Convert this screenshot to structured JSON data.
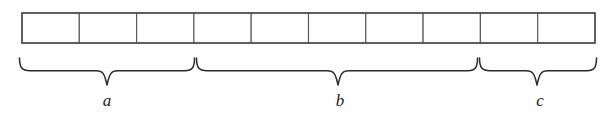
{
  "diagram": {
    "background_color": "#fefefe",
    "line_color": "#4a4a4a",
    "brace_color": "#2b2b2b",
    "label_color": "#1c1c1c",
    "bar": {
      "name": "segmented-bar",
      "x": 22,
      "y": 13,
      "width": 573,
      "height": 30,
      "cell_count": 10,
      "divider_positions": [
        79,
        136,
        193,
        250,
        307,
        364,
        421,
        478,
        535
      ],
      "cells": [
        {
          "index": 1,
          "value": ""
        },
        {
          "index": 2,
          "value": ""
        },
        {
          "index": 3,
          "value": ""
        },
        {
          "index": 4,
          "value": ""
        },
        {
          "index": 5,
          "value": ""
        },
        {
          "index": 6,
          "value": ""
        },
        {
          "index": 7,
          "value": ""
        },
        {
          "index": 8,
          "value": ""
        },
        {
          "index": 9,
          "value": ""
        },
        {
          "index": 10,
          "value": ""
        }
      ]
    },
    "groups": [
      {
        "key": "a",
        "label": "a",
        "cells": 3,
        "brace_start_x": 19,
        "brace_end_x": 194,
        "brace_mid_x": 107,
        "label_x": 107,
        "label_y": 106
      },
      {
        "key": "b",
        "label": "b",
        "cells": 5,
        "brace_start_x": 196,
        "brace_end_x": 477,
        "brace_mid_x": 338,
        "label_x": 340,
        "label_y": 106
      },
      {
        "key": "c",
        "label": "c",
        "cells": 2,
        "brace_start_x": 479,
        "brace_end_x": 596,
        "brace_mid_x": 537,
        "label_x": 540,
        "label_y": 106
      }
    ],
    "brace": {
      "top_y": 58,
      "shoulder_y": 71,
      "tip_y": 85
    }
  }
}
